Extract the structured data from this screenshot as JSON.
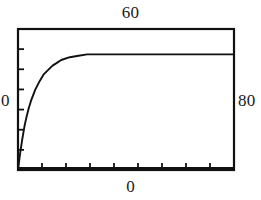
{
  "figure": {
    "name": "saturation-curve-plot",
    "background_color": "#ffffff",
    "ink_color": "#111111"
  },
  "labels": {
    "top": "60",
    "bottom": "0",
    "left": "0",
    "right": "80"
  },
  "chart_data": {
    "type": "line",
    "title": "",
    "subtitle": "",
    "xlabel": "",
    "ylabel": "",
    "grid": false,
    "legend": null,
    "annotations": [
      {
        "text": "60",
        "position": "top-center"
      },
      {
        "text": "0",
        "position": "left-middle"
      },
      {
        "text": "80",
        "position": "right-middle"
      },
      {
        "text": "0",
        "position": "bottom-center"
      }
    ],
    "axis_ticks": {
      "left_tick_count": 6,
      "bottom_tick_count": 8,
      "left_tick_direction": "inward",
      "bottom_tick_direction": "inward"
    },
    "xlim": [
      0,
      100
    ],
    "ylim": [
      0,
      100
    ],
    "series": [
      {
        "name": "saturation",
        "description": "monotonic rising exponential approach to plateau",
        "x": [
          0,
          1,
          2,
          3,
          4,
          5,
          6,
          8,
          10,
          12,
          14,
          16,
          18,
          20,
          24,
          28,
          32,
          36,
          40,
          46,
          52,
          58,
          64,
          70,
          76,
          82,
          88,
          94,
          100
        ],
        "y": [
          0,
          12,
          22,
          31,
          38,
          44,
          49,
          57,
          63,
          68,
          71,
          74,
          76,
          78,
          80,
          81,
          82,
          82,
          82,
          82,
          82,
          82,
          82,
          82,
          82,
          82,
          82,
          82,
          82
        ]
      }
    ],
    "plateau_value": 82
  }
}
